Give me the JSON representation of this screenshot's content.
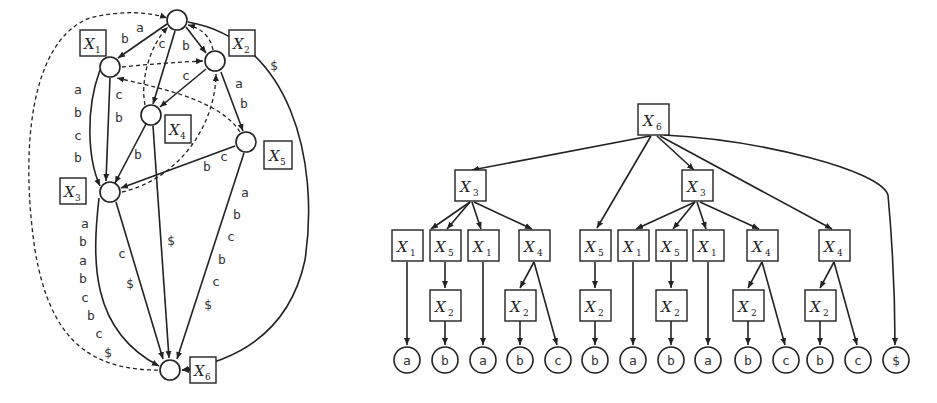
{
  "left_graph": {
    "box_labels": [
      {
        "id": "x1",
        "var": "X",
        "sub": "1"
      },
      {
        "id": "x2",
        "var": "X",
        "sub": "2"
      },
      {
        "id": "x3",
        "var": "X",
        "sub": "3"
      },
      {
        "id": "x4",
        "var": "X",
        "sub": "4"
      },
      {
        "id": "x5",
        "var": "X",
        "sub": "5"
      },
      {
        "id": "x6",
        "var": "X",
        "sub": "6"
      }
    ],
    "edge_labels": {
      "root_to_x1": [
        "a",
        "b"
      ],
      "root_to_x4": [
        "c"
      ],
      "root_to_x2": [
        "b"
      ],
      "x2_to_x4": [
        "c"
      ],
      "x2_to_x5": [
        "a",
        "b"
      ],
      "root_to_x6": [
        "$"
      ],
      "x1_to_x3_outer": [
        "a",
        "b",
        "c",
        "b"
      ],
      "x1_to_x3_inner": [
        "c",
        "b"
      ],
      "x4_to_x3": [
        "b"
      ],
      "x5_to_x3": [
        "c",
        "b"
      ],
      "x3_to_x6_outer": [
        "a",
        "b",
        "a",
        "b",
        "c",
        "b",
        "c",
        "$"
      ],
      "x3_to_x6_inner": [
        "c",
        "$"
      ],
      "x4_to_x6": [
        "$"
      ],
      "x5_to_x6": [
        "a",
        "b",
        "c",
        "b",
        "c",
        "$"
      ]
    }
  },
  "right_tree": {
    "root": {
      "var": "X",
      "sub": "6"
    },
    "level1": [
      {
        "var": "X",
        "sub": "3"
      },
      {
        "var": "X",
        "sub": "3"
      }
    ],
    "level2": [
      {
        "var": "X",
        "sub": "1"
      },
      {
        "var": "X",
        "sub": "5"
      },
      {
        "var": "X",
        "sub": "1"
      },
      {
        "var": "X",
        "sub": "4"
      },
      {
        "var": "X",
        "sub": "5"
      },
      {
        "var": "X",
        "sub": "1"
      },
      {
        "var": "X",
        "sub": "5"
      },
      {
        "var": "X",
        "sub": "1"
      },
      {
        "var": "X",
        "sub": "4"
      },
      {
        "var": "X",
        "sub": "4"
      }
    ],
    "level3": [
      {
        "var": "X",
        "sub": "2"
      },
      {
        "var": "X",
        "sub": "2"
      },
      {
        "var": "X",
        "sub": "2"
      },
      {
        "var": "X",
        "sub": "2"
      },
      {
        "var": "X",
        "sub": "2"
      },
      {
        "var": "X",
        "sub": "2"
      }
    ],
    "leaves": [
      "a",
      "b",
      "a",
      "b",
      "c",
      "b",
      "a",
      "b",
      "a",
      "b",
      "c",
      "b",
      "c",
      "$"
    ]
  }
}
